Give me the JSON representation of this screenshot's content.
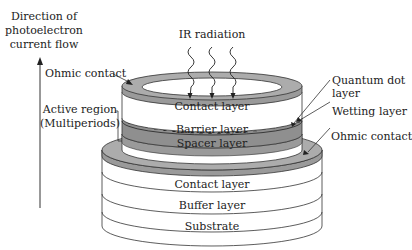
{
  "diagram": {
    "type": "QDIP device cross-section (stacked cylinders)",
    "colors": {
      "background": "#ffffff",
      "stroke": "#333333",
      "ohmic_contact": "#a8a8a8",
      "barrier": "#8f8f8f",
      "layer_white": "#ffffff",
      "dot": "#222222"
    },
    "labels": {
      "direction_line1": "Direction of",
      "direction_line2": "photoelectron",
      "direction_line3": "current flow",
      "ohmic_contact_top": "Ohmic contact",
      "active_region_line1": "Active region",
      "active_region_line2": "(Multiperiods)",
      "ir_radiation": "IR radiation",
      "quantum_dot_line1": "Quantum dot",
      "quantum_dot_line2": "layer",
      "wetting_layer": "Wetting layer",
      "ohmic_contact_bottom": "Ohmic contact"
    },
    "layers": {
      "top_contact": "Contact layer",
      "barrier": "Barrier layer",
      "spacer": "Spacer layer",
      "bottom_contact": "Contact layer",
      "buffer": "Buffer layer",
      "substrate": "Substrate"
    }
  }
}
